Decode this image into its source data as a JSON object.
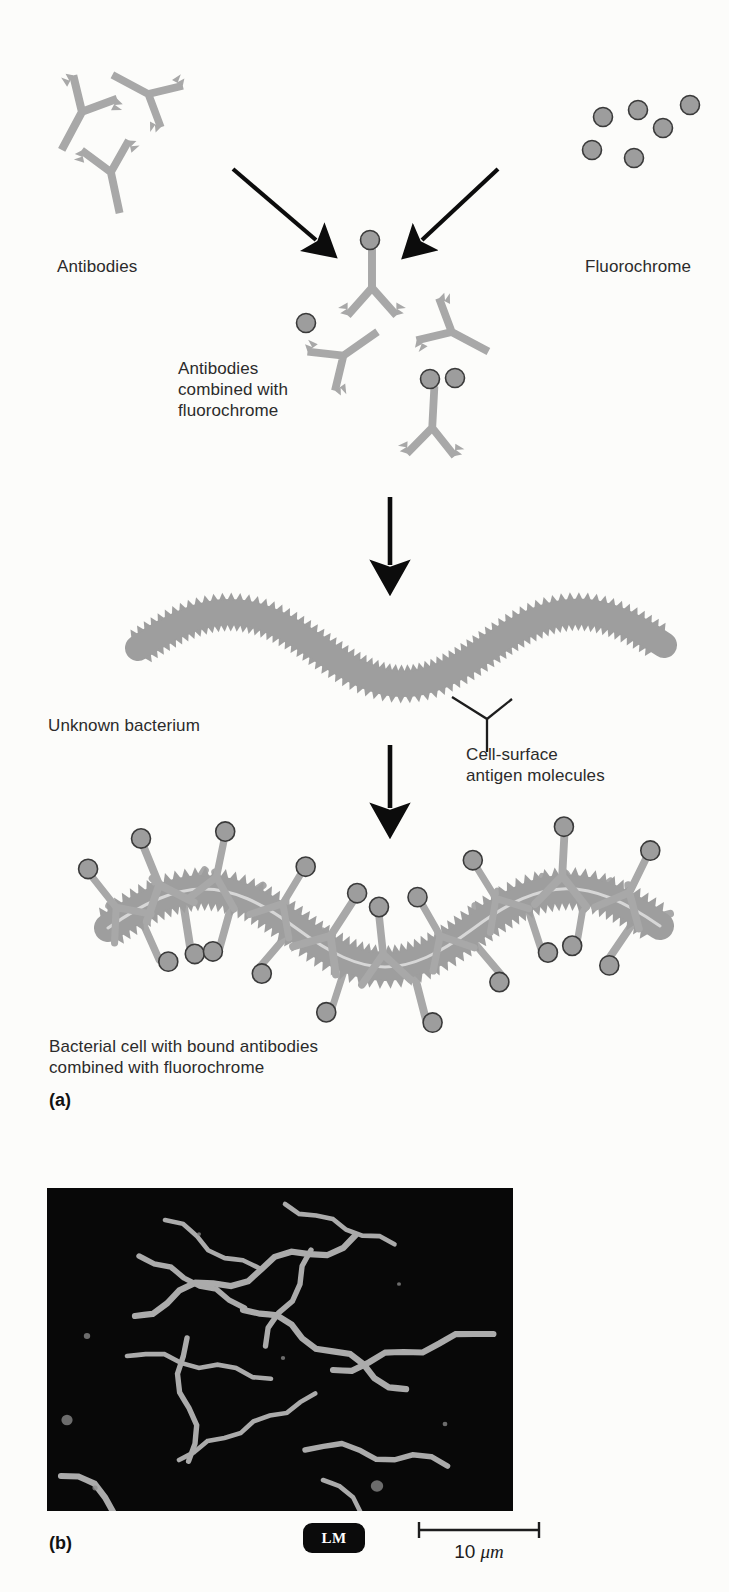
{
  "figure": {
    "domain": "scientific-illustration",
    "title_visible": false,
    "panels": [
      {
        "letter": "(a)",
        "kind": "schematic"
      },
      {
        "letter": "(b)",
        "kind": "micrograph"
      }
    ]
  },
  "labels": {
    "antibodies": "Antibodies",
    "fluorochrome": "Fluorochrome",
    "antibodies_combined_line1": "Antibodies",
    "antibodies_combined_line2": "combined with",
    "antibodies_combined_line3": "fluorochrome",
    "unknown_bacterium": "Unknown bacterium",
    "cell_surface_line1": "Cell-surface",
    "cell_surface_line2": "antigen molecules",
    "bound_line1": "Bacterial cell with bound antibodies",
    "bound_line2": "combined with fluorochrome",
    "panel_a": "(a)",
    "panel_b": "(b)"
  },
  "micrograph": {
    "badge": "LM",
    "scale_value": "10",
    "scale_unit": "μm",
    "background_color": "#080808",
    "organism_color": "#b9b9b9",
    "filament_count": 11
  },
  "colors": {
    "antibody": "#a8a8a8",
    "antibody_stroke": "#9a9a9a",
    "fluorochrome_fill": "#9d9d9d",
    "fluorochrome_stroke": "#3a3a3a",
    "bacterium": "#9e9e9e",
    "arrow": "#0c0c0c",
    "text": "#2b2b2b",
    "page_background": "#fcfcfa"
  },
  "steps": [
    {
      "id": 1,
      "description": "Antibodies and fluorochrome are mixed",
      "arrows": 2
    },
    {
      "id": 2,
      "description": "Antibodies combined with fluorochrome",
      "arrows": 1
    },
    {
      "id": 3,
      "description": "Unknown bacterium with cell-surface antigen molecules",
      "arrows": 1
    },
    {
      "id": 4,
      "description": "Bacterial cell with bound antibodies combined with fluorochrome",
      "arrows": 0
    }
  ]
}
